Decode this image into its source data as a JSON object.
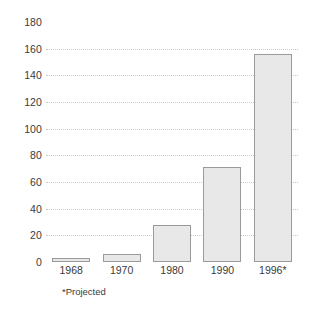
{
  "chart_data": {
    "type": "bar",
    "title": "",
    "subtitle": "",
    "xlabel": "",
    "ylabel": "",
    "categories": [
      "1968",
      "1970",
      "1980",
      "1990",
      "1996*"
    ],
    "values": [
      3,
      6,
      28,
      71,
      156
    ],
    "ylim": [
      0,
      180
    ],
    "y_ticks": [
      0,
      20,
      40,
      60,
      80,
      100,
      120,
      140,
      160,
      180
    ],
    "y_tick_labels": [
      "0",
      "20",
      "40",
      "60",
      "80",
      "100",
      "120",
      "140",
      "160",
      "180"
    ],
    "gridlines_at": [
      20,
      40,
      60,
      80,
      100,
      120,
      140,
      160
    ],
    "grid": true,
    "legend": null,
    "legend_position": "none",
    "annotations": [
      {
        "text": "*Projected",
        "position": "below-axis-left"
      }
    ],
    "series": [
      {
        "name": "",
        "values": [
          3,
          6,
          28,
          71,
          156
        ]
      }
    ],
    "style": {
      "bar_fill": "#e8e8e8",
      "bar_border": "#9a9a9a",
      "gridline_color": "#c9c9c9",
      "text_color": "#3a3a3a",
      "background": "#ffffff"
    }
  }
}
